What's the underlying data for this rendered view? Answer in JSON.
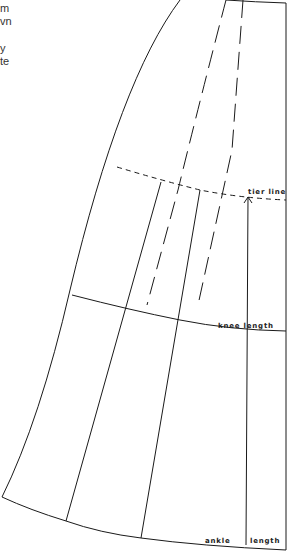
{
  "side_text_fragments": [
    "m",
    "vn",
    "y",
    "te"
  ],
  "labels": {
    "tier_line": "tier line",
    "knee_length": "knee length",
    "ankle": "ankle",
    "length": "length"
  },
  "colors": {
    "line": "#1a1a1a",
    "background": "#ffffff"
  }
}
